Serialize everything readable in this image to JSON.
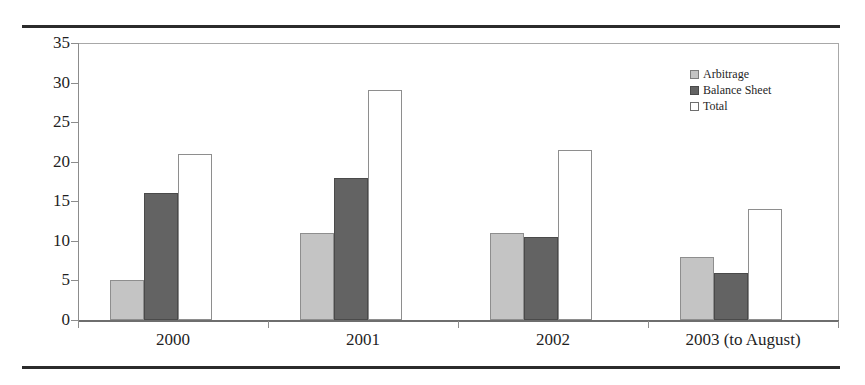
{
  "chart_data": {
    "type": "bar",
    "title": "",
    "subtitle": "",
    "xlabel": "",
    "ylabel": "",
    "categories": [
      "2000",
      "2001",
      "2002",
      "2003 (to August)"
    ],
    "series": [
      {
        "name": "Arbitrage",
        "color": "#c4c4c4",
        "values": [
          5,
          11,
          11,
          8
        ]
      },
      {
        "name": "Balance Sheet",
        "color": "#636363",
        "values": [
          16,
          18,
          10.5,
          6
        ]
      },
      {
        "name": "Total",
        "color": "#ffffff",
        "values": [
          21,
          29,
          21.5,
          14
        ]
      }
    ],
    "ylim": [
      0,
      35
    ],
    "yticks": [
      "0",
      "5",
      "10",
      "15",
      "20",
      "25",
      "30",
      "35"
    ],
    "ytick_values": [
      0,
      5,
      10,
      15,
      20,
      25,
      30,
      35
    ],
    "grid": false,
    "legend_position": "top-right",
    "legend": [
      "Arbitrage",
      "Balance Sheet",
      "Total"
    ]
  }
}
